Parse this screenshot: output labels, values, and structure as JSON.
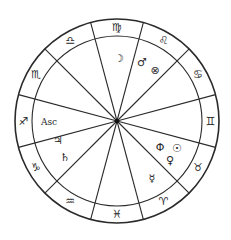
{
  "chart_title": "",
  "geometry": {
    "center": [
      117,
      121
    ],
    "outer_radius": 102,
    "inner_radius": 85,
    "spoke_start_angle_deg": 15,
    "spoke_step_deg": 30,
    "spoke_count": 12,
    "stroke_color": "#2a2a2a"
  },
  "signs": [
    {
      "name": "Virgo",
      "glyph": "♍",
      "angle": -90
    },
    {
      "name": "Leo",
      "glyph": "♌",
      "angle": -60
    },
    {
      "name": "Cancer",
      "glyph": "♋",
      "angle": -30
    },
    {
      "name": "Gemini",
      "glyph": "♊",
      "angle": 0
    },
    {
      "name": "Taurus",
      "glyph": "♉",
      "angle": 30
    },
    {
      "name": "Aries",
      "glyph": "♈",
      "angle": 60
    },
    {
      "name": "Pisces",
      "glyph": "♓",
      "angle": 90
    },
    {
      "name": "Aquarius",
      "glyph": "♒",
      "angle": 120
    },
    {
      "name": "Capricorn",
      "glyph": "♑",
      "angle": 150
    },
    {
      "name": "Sagittarius",
      "glyph": "♐",
      "angle": 180
    },
    {
      "name": "Scorpio",
      "glyph": "♏",
      "angle": 210
    },
    {
      "name": "Libra",
      "glyph": "♎",
      "angle": 240
    }
  ],
  "planets": [
    {
      "name": "Moon",
      "glyph": "☽",
      "x": 119,
      "y": 58
    },
    {
      "name": "Mars",
      "glyph": "♂",
      "x": 142,
      "y": 62
    },
    {
      "name": "Part of Fortune",
      "glyph": "⊗",
      "x": 155,
      "y": 70
    },
    {
      "name": "Jupiter",
      "glyph": "♃",
      "x": 58,
      "y": 140
    },
    {
      "name": "Saturn",
      "glyph": "♄",
      "x": 65,
      "y": 157
    },
    {
      "name": "Phi",
      "glyph": "Φ",
      "x": 160,
      "y": 147
    },
    {
      "name": "Sun",
      "glyph": "☉",
      "x": 177,
      "y": 148
    },
    {
      "name": "Venus",
      "glyph": "♀",
      "x": 170,
      "y": 160
    },
    {
      "name": "Mercury",
      "glyph": "☿",
      "x": 152,
      "y": 178
    }
  ],
  "ascendant": {
    "label": "Asc",
    "x": 49,
    "y": 122
  }
}
